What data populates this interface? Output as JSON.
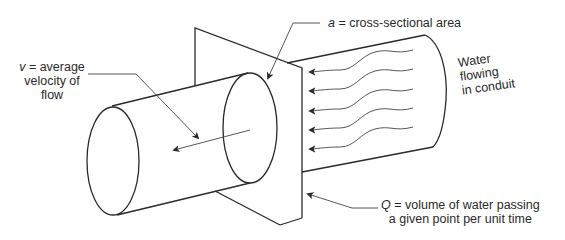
{
  "diagram": {
    "type": "flow-through-conduit",
    "labels": {
      "velocity": {
        "symbol": "v",
        "eq": " = average",
        "line2": "velocity of",
        "line3": "flow"
      },
      "area": {
        "symbol": "a",
        "text": " = cross-sectional area"
      },
      "discharge": {
        "symbol": "Q",
        "line1": " = volume of water passing",
        "line2": "a given point per unit time"
      },
      "water": {
        "line1": "Water",
        "line2": "flowing",
        "line3": "in conduit"
      }
    },
    "colors": {
      "stroke": "#2a2a2a",
      "background": "#ffffff"
    },
    "flow_arrows": 5
  }
}
